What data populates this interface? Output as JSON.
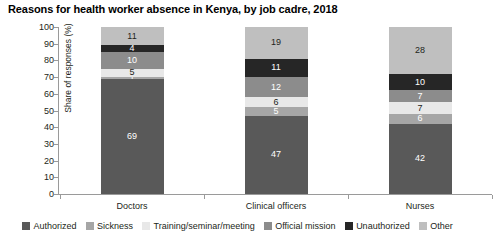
{
  "chart_data": {
    "type": "bar",
    "subtype": "stacked-column-100",
    "title": "Reasons for health worker absence in Kenya, by job cadre, 2018",
    "xlabel": "",
    "ylabel": "Share of responses (%)",
    "ylim": [
      0,
      100
    ],
    "ytick_step": 10,
    "yticks": [
      0,
      10,
      20,
      30,
      40,
      50,
      60,
      70,
      80,
      90,
      100
    ],
    "grid": false,
    "legend_position": "bottom",
    "categories": [
      "Doctors",
      "Clinical officers",
      "Nurses"
    ],
    "series": [
      {
        "name": "Authorized",
        "color": "#595959",
        "values": [
          69,
          47,
          42
        ]
      },
      {
        "name": "Sickness",
        "color": "#a6a6a6",
        "values": [
          1,
          5,
          6
        ]
      },
      {
        "name": "Training/seminar/meeting",
        "color": "#e8e8e8",
        "values": [
          5,
          6,
          7
        ]
      },
      {
        "name": "Official mission",
        "color": "#8c8c8c",
        "values": [
          10,
          12,
          7
        ]
      },
      {
        "name": "Unauthorized",
        "color": "#262626",
        "values": [
          4,
          11,
          10
        ]
      },
      {
        "name": "Other",
        "color": "#bfbfbf",
        "values": [
          11,
          19,
          28
        ]
      }
    ],
    "data_labels": {
      "Doctors": {
        "Authorized": "69",
        "Sickness": "1",
        "Training/seminar/meeting": "5",
        "Official mission": "10",
        "Unauthorized": "4",
        "Other": "11"
      },
      "Clinical officers": {
        "Authorized": "47",
        "Sickness": "5",
        "Training/seminar/meeting": "6",
        "Official mission": "12",
        "Unauthorized": "11",
        "Other": "19"
      },
      "Nurses": {
        "Authorized": "42",
        "Sickness": "6",
        "Training/seminar/meeting": "7",
        "Official mission": "7",
        "Unauthorized": "10",
        "Other": "28"
      }
    },
    "label_text_colors": {
      "Authorized": "#ffffff",
      "Sickness": "#ffffff",
      "Training/seminar/meeting": "#231f20",
      "Official mission": "#ffffff",
      "Unauthorized": "#ffffff",
      "Other": "#231f20"
    }
  }
}
